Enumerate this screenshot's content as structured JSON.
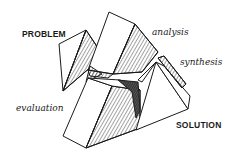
{
  "diagram": {
    "labels": {
      "problem": "PROBLEM",
      "analysis": "analysis",
      "synthesis": "synthesis",
      "evaluation": "evaluation",
      "solution": "SOLUTION"
    },
    "colors": {
      "ink": "#1a1a1a",
      "paper": "#ffffff",
      "shade": "#444444"
    }
  }
}
